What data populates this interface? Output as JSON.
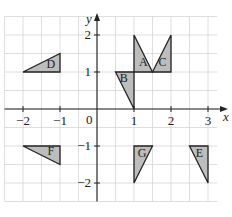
{
  "diagram": {
    "axes": {
      "x_label": "x",
      "y_label": "y",
      "x_range": [
        -2.5,
        3.25
      ],
      "y_range": [
        -2.5,
        2.5
      ],
      "x_ticks": [
        {
          "value": -2,
          "label": "−2"
        },
        {
          "value": -1,
          "label": "−1"
        },
        {
          "value": 1,
          "label": "1"
        },
        {
          "value": 2,
          "label": "2"
        },
        {
          "value": 3,
          "label": "3"
        }
      ],
      "y_ticks": [
        {
          "value": 2,
          "label": "2"
        },
        {
          "value": 1,
          "label": "1"
        },
        {
          "value": -1,
          "label": "−1"
        },
        {
          "value": -2,
          "label": "−2"
        }
      ],
      "origin_label": "0",
      "grid_step": 0.5
    },
    "shapes": [
      {
        "label": "A",
        "vertices": [
          [
            1,
            2
          ],
          [
            1,
            1
          ],
          [
            1.5,
            1
          ]
        ],
        "label_at": [
          1.25,
          1.25
        ]
      },
      {
        "label": "B",
        "vertices": [
          [
            0.5,
            1
          ],
          [
            1,
            1
          ],
          [
            1,
            0
          ]
        ],
        "label_at": [
          0.72,
          0.8
        ]
      },
      {
        "label": "C",
        "vertices": [
          [
            2,
            2
          ],
          [
            2,
            1
          ],
          [
            1.5,
            1
          ]
        ],
        "label_at": [
          1.77,
          1.25
        ]
      },
      {
        "label": "D",
        "vertices": [
          [
            -2,
            1
          ],
          [
            -1,
            1
          ],
          [
            -1,
            1.5
          ]
        ],
        "label_at": [
          -1.25,
          1.18
        ]
      },
      {
        "label": "E",
        "vertices": [
          [
            2.5,
            -1
          ],
          [
            3,
            -1
          ],
          [
            3,
            -2
          ]
        ],
        "label_at": [
          2.77,
          -1.22
        ]
      },
      {
        "label": "F",
        "vertices": [
          [
            -2,
            -1
          ],
          [
            -1,
            -1
          ],
          [
            -1,
            -1.5
          ]
        ],
        "label_at": [
          -1.25,
          -1.18
        ]
      },
      {
        "label": "G",
        "vertices": [
          [
            1,
            -1
          ],
          [
            1.5,
            -1
          ],
          [
            1,
            -2
          ]
        ],
        "label_at": [
          1.22,
          -1.22
        ]
      }
    ],
    "colors": {
      "shape_fill": "#bdbdbd",
      "grid": "#d6d6d6",
      "ink": "#222222"
    }
  }
}
